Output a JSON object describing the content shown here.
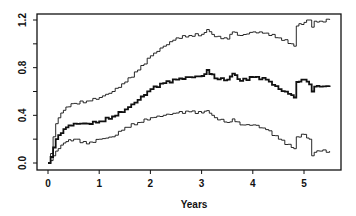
{
  "chart_data": {
    "type": "line",
    "title": "",
    "xlabel": "Years",
    "ylabel": "",
    "xlim": [
      -0.2,
      5.7
    ],
    "ylim": [
      -0.05,
      1.25
    ],
    "xticks": [
      0,
      1,
      2,
      3,
      4,
      5
    ],
    "xtick_labels": [
      "0",
      "1",
      "2",
      "3",
      "4",
      "5"
    ],
    "yticks": [
      0.0,
      0.2,
      0.4,
      0.6,
      0.8,
      1.0,
      1.2
    ],
    "ytick_labels": [
      "0.0",
      "",
      "0.4",
      "",
      "0.8",
      "",
      "1.2"
    ],
    "grid": false,
    "legend": null,
    "step": true,
    "series": [
      {
        "name": "Upper bound",
        "style": "thin",
        "x": [
          0,
          0.05,
          0.1,
          0.15,
          0.25,
          0.35,
          0.5,
          0.75,
          1.0,
          1.25,
          1.5,
          1.75,
          2.0,
          2.25,
          2.5,
          2.75,
          3.0,
          3.1,
          3.25,
          3.5,
          3.6,
          3.75,
          4.0,
          4.25,
          4.5,
          4.75,
          4.8,
          4.85,
          5.0,
          5.1,
          5.15,
          5.2,
          5.3,
          5.5
        ],
        "y": [
          0.0,
          0.08,
          0.22,
          0.33,
          0.42,
          0.47,
          0.5,
          0.52,
          0.55,
          0.6,
          0.68,
          0.78,
          0.9,
          0.98,
          1.05,
          1.07,
          1.08,
          1.12,
          1.06,
          1.04,
          1.1,
          1.07,
          1.1,
          1.09,
          1.05,
          1.0,
          0.98,
          1.15,
          1.18,
          1.2,
          1.14,
          1.19,
          1.19,
          1.2
        ]
      },
      {
        "name": "Estimate",
        "style": "thick",
        "x": [
          0,
          0.05,
          0.1,
          0.15,
          0.25,
          0.35,
          0.5,
          0.75,
          1.0,
          1.25,
          1.5,
          1.75,
          2.0,
          2.25,
          2.5,
          2.75,
          3.0,
          3.1,
          3.25,
          3.5,
          3.6,
          3.75,
          4.0,
          4.25,
          4.5,
          4.75,
          4.8,
          4.85,
          5.0,
          5.1,
          5.15,
          5.2,
          5.3,
          5.5
        ],
        "y": [
          0.0,
          0.05,
          0.13,
          0.2,
          0.25,
          0.3,
          0.33,
          0.33,
          0.35,
          0.39,
          0.45,
          0.53,
          0.62,
          0.67,
          0.7,
          0.72,
          0.73,
          0.78,
          0.71,
          0.7,
          0.75,
          0.69,
          0.72,
          0.7,
          0.62,
          0.57,
          0.55,
          0.68,
          0.7,
          0.66,
          0.6,
          0.64,
          0.64,
          0.65
        ]
      },
      {
        "name": "Lower bound",
        "style": "thin",
        "x": [
          0,
          0.05,
          0.1,
          0.15,
          0.25,
          0.35,
          0.5,
          0.75,
          1.0,
          1.25,
          1.5,
          1.75,
          2.0,
          2.25,
          2.5,
          2.75,
          3.0,
          3.1,
          3.25,
          3.5,
          3.6,
          3.75,
          4.0,
          4.25,
          4.5,
          4.75,
          4.8,
          4.85,
          5.0,
          5.1,
          5.15,
          5.2,
          5.3,
          5.5
        ],
        "y": [
          0.0,
          0.02,
          0.06,
          0.1,
          0.15,
          0.18,
          0.2,
          0.16,
          0.2,
          0.22,
          0.3,
          0.34,
          0.38,
          0.4,
          0.42,
          0.43,
          0.42,
          0.44,
          0.38,
          0.34,
          0.37,
          0.32,
          0.32,
          0.28,
          0.2,
          0.13,
          0.12,
          0.22,
          0.24,
          0.2,
          0.06,
          0.09,
          0.1,
          0.1
        ]
      }
    ]
  }
}
